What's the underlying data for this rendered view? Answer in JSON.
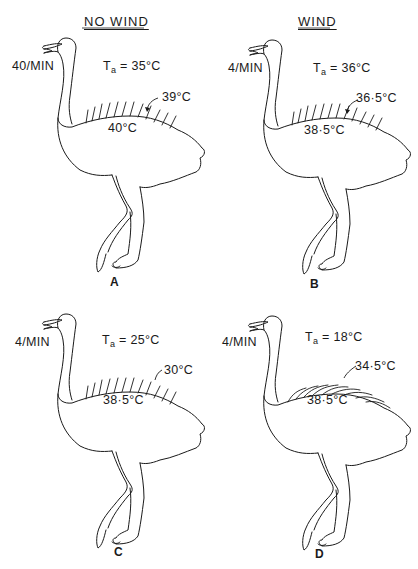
{
  "headers": {
    "left": "NO WIND",
    "right": "WIND"
  },
  "panels": [
    {
      "id": "A",
      "letter": "A",
      "condition": "NO WIND",
      "breathing_rate": "40/MIN",
      "ta_prefix": "T",
      "ta_sub": "a",
      "ta_value": " = 35°C",
      "surface_temp": "39°C",
      "skin_temp": "40°C",
      "feather_style": "erect"
    },
    {
      "id": "B",
      "letter": "B",
      "condition": "WIND",
      "breathing_rate": "4/MIN",
      "ta_prefix": "T",
      "ta_sub": "a",
      "ta_value": " = 36°C",
      "surface_temp": "36·5°C",
      "skin_temp": "38·5°C",
      "feather_style": "erect"
    },
    {
      "id": "C",
      "letter": "C",
      "condition": "",
      "breathing_rate": "4/MIN",
      "ta_prefix": "T",
      "ta_sub": "a",
      "ta_value": " = 25°C",
      "surface_temp": "30°C",
      "skin_temp": "38·5°C",
      "feather_style": "erect"
    },
    {
      "id": "D",
      "letter": "D",
      "condition": "",
      "breathing_rate": "4/MIN",
      "ta_prefix": "T",
      "ta_sub": "a",
      "ta_value": " = 18°C",
      "surface_temp": "34·5°C",
      "skin_temp": "38·5°C",
      "feather_style": "flattened"
    }
  ],
  "colors": {
    "line": "#1a1a1a",
    "background": "#ffffff"
  }
}
